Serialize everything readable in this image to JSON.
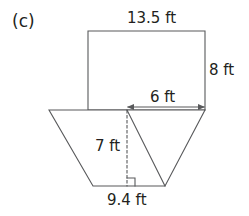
{
  "figure": {
    "part_label": "(c)",
    "stroke_color": "#58595b",
    "text_color": "#231f20",
    "background_color": "#ffffff",
    "labels": {
      "rectangle_top": "13.5 ft",
      "rectangle_right": "8 ft",
      "trapezoid_top_right": "6 ft",
      "trapezoid_height": "7 ft",
      "trapezoid_bottom": "9.4 ft"
    },
    "shapes": [
      {
        "name": "rectangle",
        "type": "rectangle",
        "vertices": [
          [
            88,
            31
          ],
          [
            205,
            31
          ],
          [
            205,
            110
          ],
          [
            88,
            110
          ]
        ],
        "dimensions": {
          "width": "13.5 ft",
          "height": "8 ft"
        }
      },
      {
        "name": "trapezoid",
        "type": "trapezoid",
        "vertices": [
          [
            49,
            110
          ],
          [
            205,
            110
          ],
          [
            165,
            186
          ],
          [
            93,
            186
          ]
        ],
        "dimensions": {
          "bottom": "9.4 ft",
          "height": "7 ft"
        }
      },
      {
        "name": "inner-slant-line",
        "type": "line",
        "vertices": [
          [
            127,
            110
          ],
          [
            165,
            186
          ]
        ]
      },
      {
        "name": "height-dashed-line",
        "type": "dashed-line",
        "vertices": [
          [
            127,
            110
          ],
          [
            127,
            186
          ]
        ]
      },
      {
        "name": "right-angle-marker",
        "type": "square-marker",
        "vertices": [
          [
            127,
            178
          ],
          [
            135,
            178
          ],
          [
            135,
            186
          ]
        ]
      },
      {
        "name": "six-ft-dimension-arrow",
        "type": "double-arrow",
        "vertices": [
          [
            127,
            107
          ],
          [
            205,
            107
          ]
        ],
        "value": "6 ft"
      }
    ]
  }
}
